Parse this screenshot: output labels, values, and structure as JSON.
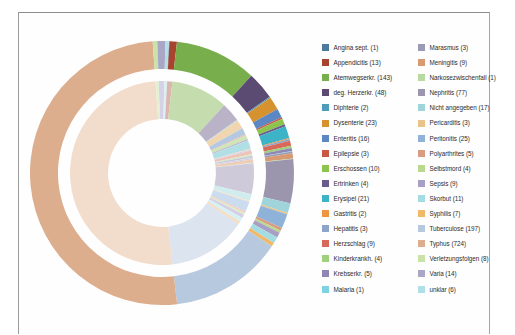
{
  "figure": {
    "type": "donut",
    "frame_border_color": "#9a9a9a",
    "background": "#ffffff"
  },
  "chart_data": {
    "type": "pie",
    "title": "",
    "subtitle": "",
    "xlabel": "",
    "ylabel": "",
    "legend_position": "right",
    "rings": [
      {
        "name": "outer-ring",
        "style": "saturated"
      },
      {
        "name": "inner-ring",
        "style": "pastel"
      }
    ],
    "total": 1566,
    "categories": [
      "Angina sept.",
      "Appendicitis",
      "Atemwegserkr.",
      "deg. Herzerkr.",
      "Diphterie",
      "Dysenterie",
      "Enteritis",
      "Epilepsie",
      "Erschossen",
      "Ertrinken",
      "Erysipel",
      "Gastritis",
      "Hepatitis",
      "Herzschlag",
      "Kinderkrankh.",
      "Krebserkr.",
      "Malaria",
      "Marasmus",
      "Meningitis",
      "Narkosezwischenfall",
      "Nephritis",
      "Nicht angegeben",
      "Pericarditis",
      "Peritonitis",
      "Polyarthrites",
      "Selbstmord",
      "Sepsis",
      "Skorbut",
      "Syphilis",
      "Tuberculose",
      "Typhus",
      "Verletzungsfolgen",
      "Varia",
      "unklar"
    ],
    "values": [
      1,
      13,
      143,
      48,
      2,
      23,
      16,
      3,
      10,
      4,
      21,
      2,
      3,
      9,
      4,
      5,
      1,
      3,
      9,
      1,
      77,
      17,
      3,
      25,
      5,
      4,
      9,
      11,
      7,
      197,
      724,
      8,
      14,
      6
    ],
    "colors_outer": [
      "#4d7b9e",
      "#a8432f",
      "#78ae4c",
      "#5b4a72",
      "#4f9cb8",
      "#d6922f",
      "#5b87c4",
      "#c85a44",
      "#8cc44e",
      "#6a5b8c",
      "#3cb3c6",
      "#ef9440",
      "#8ba4c9",
      "#d8695a",
      "#9fd07c",
      "#8f86b5",
      "#7fd3e0",
      "#9a9ab5",
      "#d79a73",
      "#b8d9a0",
      "#9b96ae",
      "#9fd4da",
      "#e8c38a",
      "#8fb2d8",
      "#d99c82",
      "#b9d98f",
      "#a89fc4",
      "#a4dce4",
      "#f0b96a",
      "#b7c9df",
      "#dcae8e",
      "#c9e2a8",
      "#a9a6c6",
      "#b0dfe8"
    ],
    "colors_inner": [
      "#b7c9d8",
      "#dcb5ac",
      "#c4dcae",
      "#bab2c6",
      "#b3d6e0",
      "#efd6b0",
      "#b5c8e2",
      "#e6b8ae",
      "#cde6b4",
      "#c0b8d0",
      "#b0e0e6",
      "#f7d3b0",
      "#cdd8e8",
      "#f0c2bb",
      "#d5ecc0",
      "#cbc6de",
      "#c8ecf2",
      "#cfcfdc",
      "#edcdb8",
      "#dceccd",
      "#cecad9",
      "#d1ecef",
      "#f3e2c8",
      "#cbdcee",
      "#eecfc2",
      "#dcecc6",
      "#d4cfe4",
      "#d6f0f4",
      "#f8dcbc",
      "#dbe4ef",
      "#f2dccb",
      "#e4f0d4",
      "#d4d2e4",
      "#d9f0f4"
    ]
  },
  "legend": {
    "columns": [
      {
        "name": "left-column",
        "items": [
          {
            "label": "Angina sept. (1)",
            "color": "#4d7b9e",
            "value": 1
          },
          {
            "label": "Appendicitis (13)",
            "color": "#a8432f",
            "value": 13
          },
          {
            "label": "Atemwegserkr. (143)",
            "color": "#78ae4c",
            "value": 143
          },
          {
            "label": "deg. Herzerkr. (48)",
            "color": "#5b4a72",
            "value": 48
          },
          {
            "label": "Diphterie (2)",
            "color": "#4f9cb8",
            "value": 2
          },
          {
            "label": "Dysenterie (23)",
            "color": "#d6922f",
            "value": 23
          },
          {
            "label": "Enteritis (16)",
            "color": "#5b87c4",
            "value": 16
          },
          {
            "label": "Epilepsie (3)",
            "color": "#c85a44",
            "value": 3
          },
          {
            "label": "Erschossen (10)",
            "color": "#8cc44e",
            "value": 10
          },
          {
            "label": "Ertrinken (4)",
            "color": "#6a5b8c",
            "value": 4
          },
          {
            "label": "Erysipel (21)",
            "color": "#3cb3c6",
            "value": 21
          },
          {
            "label": "Gastritis (2)",
            "color": "#ef9440",
            "value": 2
          },
          {
            "label": "Hepatitis (3)",
            "color": "#8ba4c9",
            "value": 3
          },
          {
            "label": "Herzschlag (9)",
            "color": "#d8695a",
            "value": 9
          },
          {
            "label": "Kinderkrankh. (4)",
            "color": "#9fd07c",
            "value": 4
          },
          {
            "label": "Krebserkr. (5)",
            "color": "#8f86b5",
            "value": 5
          },
          {
            "label": "Malaria (1)",
            "color": "#7fd3e0",
            "value": 1
          }
        ]
      },
      {
        "name": "right-column",
        "items": [
          {
            "label": "Marasmus (3)",
            "color": "#9a9ab5",
            "value": 3
          },
          {
            "label": "Meningitis (9)",
            "color": "#d79a73",
            "value": 9
          },
          {
            "label": "Narkosezwischenfall (1)",
            "color": "#b8d9a0",
            "value": 1
          },
          {
            "label": "Nephritis (77)",
            "color": "#9b96ae",
            "value": 77
          },
          {
            "label": "Nicht angegeben (17)",
            "color": "#9fd4da",
            "value": 17
          },
          {
            "label": "Pericarditis (3)",
            "color": "#e8c38a",
            "value": 3
          },
          {
            "label": "Peritonitis (25)",
            "color": "#8fb2d8",
            "value": 25
          },
          {
            "label": "Polyarthrites (5)",
            "color": "#d99c82",
            "value": 5
          },
          {
            "label": "Selbstmord (4)",
            "color": "#b9d98f",
            "value": 4
          },
          {
            "label": "Sepsis (9)",
            "color": "#a89fc4",
            "value": 9
          },
          {
            "label": "Skorbut (11)",
            "color": "#a4dce4",
            "value": 11
          },
          {
            "label": "Syphilis (7)",
            "color": "#f0b96a",
            "value": 7
          },
          {
            "label": "Tuberculose (197)",
            "color": "#b7c9df",
            "value": 197
          },
          {
            "label": "Typhus (724)",
            "color": "#dcae8e",
            "value": 724
          },
          {
            "label": "Verletzungsfolgen (8)",
            "color": "#c9e2a8",
            "value": 8
          },
          {
            "label": "Varia (14)",
            "color": "#a9a6c6",
            "value": 14
          },
          {
            "label": "unklar (6)",
            "color": "#b0dfe8",
            "value": 6
          }
        ]
      }
    ]
  }
}
